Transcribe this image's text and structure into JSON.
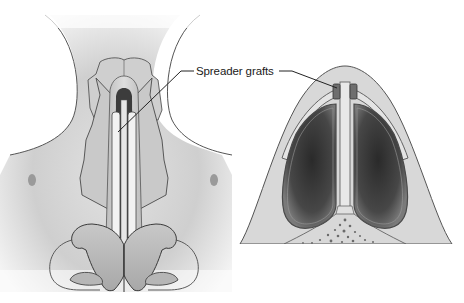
{
  "figure": {
    "type": "medical-illustration",
    "panels": [
      {
        "id": "frontal-view",
        "description": "frontal view of nose showing spreader grafts along dorsal septum"
      },
      {
        "id": "cross-section",
        "description": "axial cross-section of nasal vault showing spreader grafts beside septum"
      }
    ],
    "labels": [
      {
        "text": "Spreader grafts",
        "points_to": [
          "frontal-view",
          "cross-section"
        ]
      }
    ]
  },
  "colors": {
    "background": "#ffffff",
    "skin": "#d6d6d6",
    "skin_light": "#e8e8e8",
    "cartilage": "#c4c4c4",
    "cartilage_light": "#dcdcdc",
    "airway_dark": "#3a3a3a",
    "airway_mid": "#6a6a6a",
    "graft": "#6e6e6e",
    "outline": "#444444",
    "leader_line": "#222222"
  }
}
